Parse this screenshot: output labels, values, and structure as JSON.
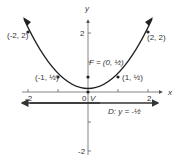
{
  "diagram": {
    "type": "parabola",
    "equation": "y = x^2 / 2",
    "axes": {
      "x_label": "x",
      "y_label": "y",
      "x_ticks": [
        {
          "value": -2,
          "label": "-2"
        },
        {
          "value": -1,
          "label": ""
        },
        {
          "value": 1,
          "label": ""
        },
        {
          "value": 2,
          "label": "2"
        }
      ],
      "y_ticks": [
        {
          "value": 2,
          "label": "2"
        },
        {
          "value": 1,
          "label": ""
        },
        {
          "value": -1,
          "label": ""
        },
        {
          "value": -2,
          "label": "-2"
        }
      ],
      "origin_label": "0"
    },
    "points": [
      {
        "label": "(-2, 2)",
        "x": -2,
        "y": 2
      },
      {
        "label": "(-1, ½)",
        "x": -1,
        "y": 0.5
      },
      {
        "label": "(1, ½)",
        "x": 1,
        "y": 0.5
      },
      {
        "label": "(2, 2)",
        "x": 2,
        "y": 2
      }
    ],
    "focus": {
      "label": "F = (0, ½)",
      "x": 0,
      "y": 0.5
    },
    "vertex": {
      "label": "V",
      "x": 0,
      "y": 0
    },
    "directrix": {
      "label": "D: y = -½",
      "y": -0.5
    },
    "colors": {
      "curve": "#222222",
      "axis": "#555555",
      "text": "#333333"
    }
  }
}
